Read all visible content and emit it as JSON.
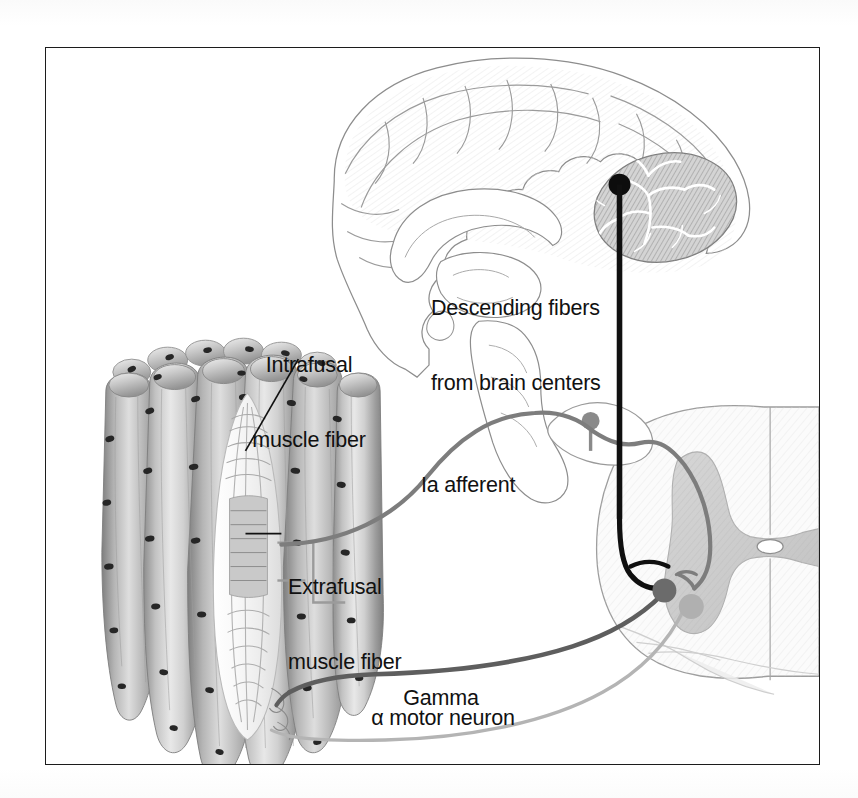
{
  "figure": {
    "kind": "anatomical-diagram",
    "frame": {
      "border_color": "#1c1c1c",
      "background": "#ffffff"
    }
  },
  "labels": {
    "intrafusal": {
      "line1": "Intrafusal",
      "line2": "muscle fiber"
    },
    "extrafusal": {
      "line1": "Extrafusal",
      "line2": "muscle fiber"
    },
    "descending": {
      "line1": "Descending fibers",
      "line2": "from brain centers"
    },
    "ia_afferent": {
      "text": "Ia afferent"
    },
    "gamma": {
      "line1": "Gamma",
      "line2": "motor neuron"
    },
    "alpha": {
      "text": "α motor neuron"
    }
  },
  "structures": {
    "brain": {
      "name": "mid-sagittal brain section",
      "parts": [
        "cerebral cortex",
        "corpus callosum",
        "cerebellum",
        "brainstem"
      ]
    },
    "spinal_cord": {
      "name": "spinal cord cross section",
      "parts": [
        "gray matter",
        "white matter",
        "central canal",
        "dorsal root ganglion",
        "ventral horn"
      ]
    },
    "muscle": {
      "name": "skeletal muscle bundle with muscle spindle",
      "parts": [
        "extrafusal muscle fibers",
        "muscle spindle capsule",
        "intrafusal muscle fibers"
      ]
    }
  },
  "pathways": {
    "descending": {
      "label": "descending fibers",
      "color": "#101010",
      "width": 5.5
    },
    "ia_afferent": {
      "label": "Ia afferent",
      "color": "#7d7d7d",
      "width": 4.2
    },
    "gamma_motor": {
      "label": "Gamma motor neuron",
      "color": "#5e5e5e",
      "width": 4.6
    },
    "alpha_motor": {
      "label": "alpha motor neuron",
      "color": "#b4b4b4",
      "width": 3.4
    }
  },
  "colors": {
    "ink": "#111111",
    "frame": "#1c1c1c",
    "gray_matter": "#cfcfcf",
    "white_matter": "#f4f4f4",
    "outline": "#9a9a9a",
    "muscle_light": "#e3e3e3",
    "muscle_mid": "#b8b8b8",
    "muscle_dark": "#8a8a8a",
    "nucleus": "#2a2a2a"
  }
}
